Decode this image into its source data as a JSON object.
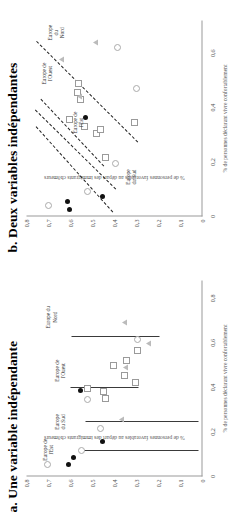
{
  "figure": {
    "background": "#ffffff",
    "orientation": "rotated-90-ccw"
  },
  "panels": [
    {
      "id": "b",
      "title": "b. Deux variables indépendantes",
      "axis": {
        "xlabel": "% de personnes déclarant vivre confortablement",
        "ylabel": "% de personnes favorables au départ des immigrants chômeurs",
        "xticks": [
          "0",
          "0,2",
          "0,4",
          "0,6"
        ],
        "xtick_values": [
          0,
          0.2,
          0.4,
          0.6
        ],
        "yticks": [
          "0",
          "0,1",
          "0,2",
          "0,3",
          "0,4",
          "0,5",
          "0,6",
          "0,7",
          "0,8"
        ],
        "ytick_values": [
          0,
          0.1,
          0.2,
          0.3,
          0.4,
          0.5,
          0.6,
          0.7,
          0.8
        ],
        "xlim": [
          0,
          0.72
        ],
        "ylim": [
          0,
          0.8
        ],
        "grid": false
      },
      "group_labels": [
        {
          "text": "Europe de\nl'Est",
          "x": 0.345,
          "y": 0.565
        },
        {
          "text": "Europe\ndu Sud",
          "x": 0.145,
          "y": 0.325
        },
        {
          "text": "Europe de\nl'Ouest",
          "x": 0.525,
          "y": 0.705
        },
        {
          "text": "Europe du\nNord",
          "x": 0.675,
          "y": 0.665
        }
      ]
    },
    {
      "id": "a",
      "title": "a. Une variable indépendante",
      "axis": {
        "xlabel": "% de personnes déclarant vivre confortablement",
        "ylabel": "% de personnes favorables au départ des immigrants chômeurs",
        "xticks": [
          "0",
          "0,2",
          "0,4",
          "0,6",
          "0,8"
        ],
        "xtick_values": [
          0,
          0.2,
          0.4,
          0.6,
          0.8
        ],
        "yticks": [
          "0",
          "0,1",
          "0,2",
          "0,3",
          "0,4",
          "0,5",
          "0,6",
          "0,7",
          "0,8"
        ],
        "ytick_values": [
          0,
          0.1,
          0.2,
          0.3,
          0.4,
          0.5,
          0.6,
          0.7,
          0.8
        ],
        "xlim": [
          0,
          0.88
        ],
        "ylim": [
          0,
          0.8
        ],
        "grid": false
      },
      "group_labels": [
        {
          "text": "Europe de\nl'Est",
          "x": 0.12,
          "y": 0.7
        },
        {
          "text": "Europe\ndu Sud",
          "x": 0.245,
          "y": 0.645
        },
        {
          "text": "Europe de\nl'Ouest",
          "x": 0.475,
          "y": 0.645
        },
        {
          "text": "Europe du\nNord",
          "x": 0.715,
          "y": 0.685
        }
      ]
    }
  ],
  "chart_data": [
    {
      "panel": "b",
      "type": "scatter",
      "title": "b. Deux variables indépendantes",
      "xlabel": "% de personnes déclarant vivre confortablement",
      "ylabel": "% de personnes favorables au départ des immigrants chômeurs",
      "xlim": [
        0,
        0.72
      ],
      "ylim": [
        0,
        0.8
      ],
      "grid": false,
      "legend": "none",
      "series": [
        {
          "name": "Europe de l'Est",
          "marker": "filled-circle",
          "color": "#111111",
          "points": [
            {
              "x": 0.025,
              "y": 0.605
            },
            {
              "x": 0.055,
              "y": 0.615
            },
            {
              "x": 0.075,
              "y": 0.455
            },
            {
              "x": 0.365,
              "y": 0.53
            }
          ]
        },
        {
          "name": "Europe du Sud",
          "marker": "open-circle",
          "color": "#aaaaaa",
          "points": [
            {
              "x": 0.04,
              "y": 0.7
            },
            {
              "x": 0.09,
              "y": 0.525
            },
            {
              "x": 0.195,
              "y": 0.395
            },
            {
              "x": 0.47,
              "y": 0.3
            },
            {
              "x": 0.62,
              "y": 0.385
            }
          ]
        },
        {
          "name": "Europe de l'Ouest",
          "marker": "square",
          "color": "#9a9a9a",
          "points": [
            {
              "x": 0.215,
              "y": 0.44
            },
            {
              "x": 0.305,
              "y": 0.48
            },
            {
              "x": 0.32,
              "y": 0.465
            },
            {
              "x": 0.33,
              "y": 0.535
            },
            {
              "x": 0.355,
              "y": 0.605
            },
            {
              "x": 0.43,
              "y": 0.555
            },
            {
              "x": 0.455,
              "y": 0.57
            },
            {
              "x": 0.49,
              "y": 0.565
            },
            {
              "x": 0.345,
              "y": 0.31
            }
          ]
        },
        {
          "name": "Europe du Nord",
          "marker": "triangle",
          "color": "#bbbbbb",
          "points": [
            {
              "x": 0.44,
              "y": 0.56
            },
            {
              "x": 0.575,
              "y": 0.64
            },
            {
              "x": 0.64,
              "y": 0.485
            }
          ]
        }
      ],
      "regression_lines": [
        {
          "name": "Europe de l'Est",
          "x0": 0.015,
          "y0": 0.41,
          "x1": 0.33,
          "y1": 0.76,
          "style": "dashed"
        },
        {
          "name": "Europe du Sud",
          "x0": 0.1,
          "y0": 0.395,
          "x1": 0.39,
          "y1": 0.76,
          "style": "dashed"
        },
        {
          "name": "Europe de l'Ouest",
          "x0": 0.185,
          "y0": 0.45,
          "x1": 0.43,
          "y1": 0.735,
          "style": "dashed"
        },
        {
          "name": "Europe du Nord",
          "x0": 0.27,
          "y0": 0.295,
          "x1": 0.64,
          "y1": 0.755,
          "style": "dashed"
        }
      ]
    },
    {
      "panel": "a",
      "type": "scatter",
      "title": "a. Une variable indépendante",
      "xlabel": "% de personnes déclarant vivre confortablement",
      "ylabel": "% de personnes favorables au départ des immigrants chômeurs",
      "xlim": [
        0,
        0.88
      ],
      "ylim": [
        0,
        0.8
      ],
      "grid": false,
      "legend": "none",
      "series": [
        {
          "name": "Europe de l'Est",
          "marker": "filled-circle",
          "color": "#111111",
          "points": [
            {
              "x": 0.055,
              "y": 0.61
            },
            {
              "x": 0.085,
              "y": 0.585
            },
            {
              "x": 0.155,
              "y": 0.455
            },
            {
              "x": 0.385,
              "y": 0.555
            }
          ]
        },
        {
          "name": "Europe du Sud",
          "marker": "open-circle",
          "color": "#aaaaaa",
          "points": [
            {
              "x": 0.055,
              "y": 0.705
            },
            {
              "x": 0.115,
              "y": 0.55
            },
            {
              "x": 0.215,
              "y": 0.465
            },
            {
              "x": 0.345,
              "y": 0.525
            },
            {
              "x": 0.615,
              "y": 0.295
            }
          ]
        },
        {
          "name": "Europe de l'Ouest",
          "marker": "square",
          "color": "#9a9a9a",
          "points": [
            {
              "x": 0.35,
              "y": 0.44
            },
            {
              "x": 0.38,
              "y": 0.45
            },
            {
              "x": 0.395,
              "y": 0.525
            },
            {
              "x": 0.42,
              "y": 0.305
            },
            {
              "x": 0.455,
              "y": 0.355
            },
            {
              "x": 0.5,
              "y": 0.405
            },
            {
              "x": 0.52,
              "y": 0.345
            },
            {
              "x": 0.565,
              "y": 0.295
            }
          ]
        },
        {
          "name": "Europe du Nord",
          "marker": "triangle",
          "color": "#bbbbbb",
          "points": [
            {
              "x": 0.255,
              "y": 0.37
            },
            {
              "x": 0.49,
              "y": 0.35
            },
            {
              "x": 0.595,
              "y": 0.245
            },
            {
              "x": 0.69,
              "y": 0.355
            }
          ]
        }
      ],
      "interval_lines": [
        {
          "name": "Europe de l'Est",
          "x": 0.115,
          "y0": 0.02,
          "y1": 0.56
        },
        {
          "name": "Europe du Sud",
          "x": 0.245,
          "y0": 0.02,
          "y1": 0.53
        },
        {
          "name": "Europe de l'Ouest",
          "x": 0.4,
          "y0": 0.29,
          "y1": 0.6
        },
        {
          "name": "Europe du Nord",
          "x": 0.63,
          "y0": 0.195,
          "y1": 0.595
        }
      ]
    }
  ]
}
